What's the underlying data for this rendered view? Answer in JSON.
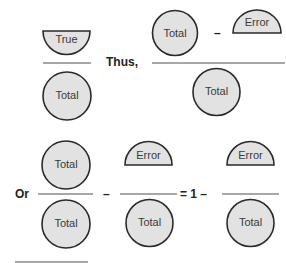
{
  "diagram": {
    "labels": {
      "true": "True",
      "total": "Total",
      "error": "Error"
    },
    "words": {
      "thus": "Thus,",
      "or": "Or"
    },
    "operators": {
      "minus": "–",
      "equals_one_minus": "= 1 –"
    },
    "equations": [
      {
        "name": "true-over-total",
        "numerator": [
          "True"
        ],
        "denominator": [
          "Total"
        ]
      },
      {
        "name": "total-minus-error-over-total",
        "numerator": [
          "Total",
          "–",
          "Error"
        ],
        "denominator": [
          "Total"
        ]
      },
      {
        "name": "total-over-total-minus-error-over-total",
        "terms": [
          "Total/Total",
          "–",
          "Error/Total",
          "= 1 –",
          "Error/Total"
        ]
      }
    ],
    "colors": {
      "shape_fill": "#e2e2e2",
      "shape_stroke": "#2a2a2a",
      "bar": "#8a8a8a"
    }
  }
}
